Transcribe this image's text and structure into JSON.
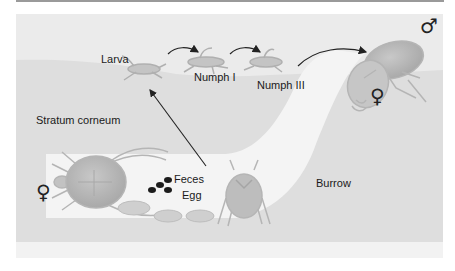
{
  "diagram": {
    "labels": {
      "larva": "Larva",
      "nymph1": "Numph I",
      "nymph3": "Numph III",
      "stratum": "Stratum corneum",
      "feces": "Feces",
      "egg": "Egg",
      "burrow": "Burrow"
    },
    "symbols": {
      "male": "♂",
      "female_top": "♀",
      "female_left": "♀"
    },
    "stages": [
      "Larva",
      "Numph I",
      "Numph III",
      "Adult (mating)",
      "Gravid female in burrow"
    ],
    "colors": {
      "surface": "#ececec",
      "skin": "#dedede",
      "burrow": "#f4f4f4",
      "mite": "#b9b9b9",
      "feces": "#1c1c1c",
      "arrow": "#222222"
    }
  }
}
